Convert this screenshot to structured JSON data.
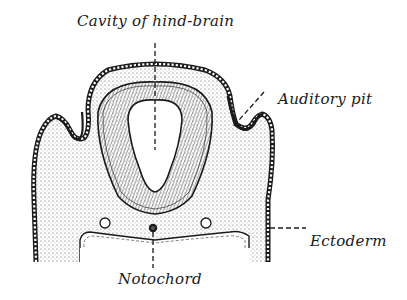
{
  "figure": {
    "type": "anatomical cross-section"
  },
  "labels": {
    "cavity": "Cavity of hind-brain",
    "auditory": "Auditory pit",
    "ectoderm": "Ectoderm",
    "notochord": "Notochord"
  },
  "colors": {
    "ink": "#1a1a1a",
    "stipple": "#555555",
    "background": "#ffffff"
  }
}
